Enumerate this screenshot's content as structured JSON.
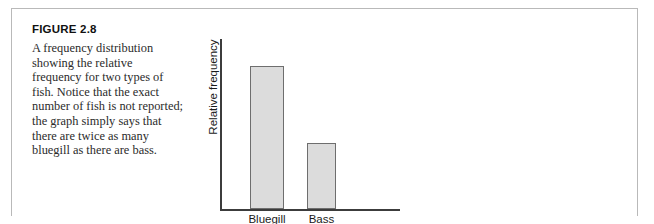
{
  "figure": {
    "label": "FIGURE 2.8",
    "caption": "A frequency distribution showing the relative frequency for two types of fish. Notice that the exact number of fish is not reported; the graph simply says that there are twice as many bluegill as there are bass."
  },
  "colors": {
    "bar_fill": "#dcdcdc",
    "bar_stroke": "#6e6e6e",
    "axis": "#3c3c3c",
    "panel_border": "#b9b9b9",
    "text": "#1a1a1a"
  },
  "chart_data": {
    "type": "bar",
    "title": "",
    "categories": [
      "Bluegill",
      "Bass"
    ],
    "values": [
      2,
      1
    ],
    "xlabel": "Type of fish",
    "ylabel": "Relative frequency",
    "ylim": [
      0,
      2.4
    ],
    "grid": false,
    "legend": false,
    "tick_labels_y": [],
    "annotations": []
  }
}
